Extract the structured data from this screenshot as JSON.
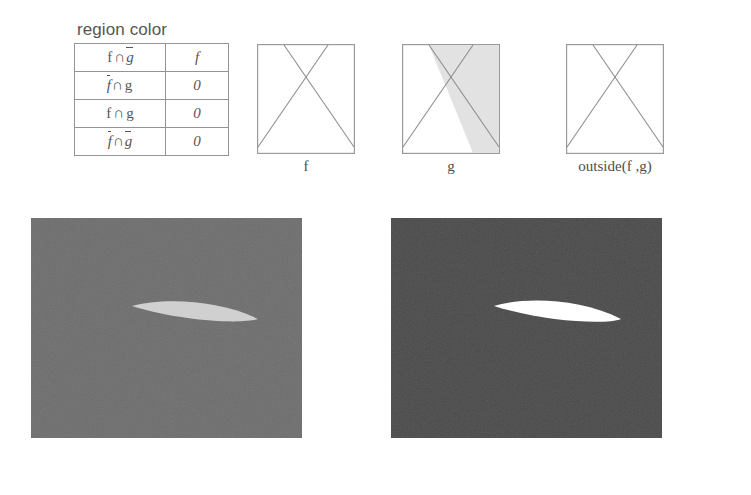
{
  "table": {
    "caption": "region color",
    "columns": [
      "region",
      "color"
    ],
    "rows": [
      {
        "region": "f ∩ ḡ",
        "color": "f",
        "region_parts": [
          {
            "sym": "f",
            "bar": false
          },
          {
            "sym": "∩",
            "op": true
          },
          {
            "sym": "g",
            "bar": true
          }
        ]
      },
      {
        "region": "f̄ ∩ g",
        "color": "0",
        "region_parts": [
          {
            "sym": "f",
            "bar": true
          },
          {
            "sym": "∩",
            "op": true
          },
          {
            "sym": "g",
            "bar": false
          }
        ]
      },
      {
        "region": "f ∩ g",
        "color": "0",
        "region_parts": [
          {
            "sym": "f",
            "bar": false
          },
          {
            "sym": "∩",
            "op": true
          },
          {
            "sym": "g",
            "bar": false
          }
        ]
      },
      {
        "region": "f̄ ∩ ḡ",
        "color": "0",
        "region_parts": [
          {
            "sym": "f",
            "bar": true
          },
          {
            "sym": "∩",
            "op": true
          },
          {
            "sym": "g",
            "bar": true
          }
        ]
      }
    ]
  },
  "diagrams": [
    {
      "id": "f",
      "label": "f",
      "shaded": false
    },
    {
      "id": "g",
      "label": "g",
      "shaded": true
    },
    {
      "id": "outside",
      "label": "outside(f ,g)",
      "shaded": false
    }
  ],
  "renders": [
    {
      "id": "left",
      "background_color": "#6e6e6e",
      "shape_color": "#c6c6c6",
      "shape_name": "lens-sliver"
    },
    {
      "id": "right",
      "background_color": "#4a4a4a",
      "shape_color": "#ffffff",
      "shape_name": "lens-sliver"
    }
  ],
  "colors": {
    "line": "#8e8e8e",
    "shade": "#e2e2e2",
    "text": "#555555",
    "border": "#949494"
  }
}
